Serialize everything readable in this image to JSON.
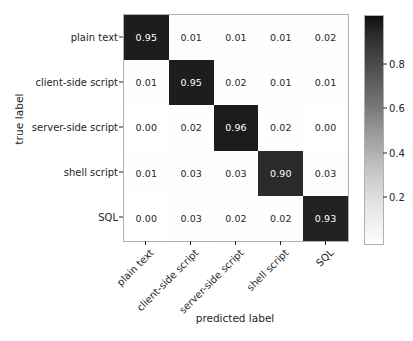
{
  "chart_data": {
    "type": "heatmap",
    "title": "",
    "xlabel": "predicted label",
    "ylabel": "true label",
    "categories": [
      "plain text",
      "client-side script",
      "server-side script",
      "shell script",
      "SQL"
    ],
    "x_tick_labels": [
      "plain text",
      "client-side script",
      "server-side script",
      "shell script",
      "SQL"
    ],
    "y_tick_labels": [
      "plain text",
      "client-side script",
      "server-side script",
      "shell script",
      "SQL"
    ],
    "rows": [
      {
        "label": "plain text",
        "values": [
          0.95,
          0.01,
          0.01,
          0.01,
          0.02
        ]
      },
      {
        "label": "client-side script",
        "values": [
          0.01,
          0.95,
          0.02,
          0.01,
          0.01
        ]
      },
      {
        "label": "server-side script",
        "values": [
          0.0,
          0.02,
          0.96,
          0.02,
          0.0
        ]
      },
      {
        "label": "shell script",
        "values": [
          0.01,
          0.03,
          0.03,
          0.9,
          0.03
        ]
      },
      {
        "label": "SQL",
        "values": [
          0.0,
          0.03,
          0.02,
          0.02,
          0.93
        ]
      }
    ],
    "cell_text": [
      [
        "0.95",
        "0.01",
        "0.01",
        "0.01",
        "0.02"
      ],
      [
        "0.01",
        "0.95",
        "0.02",
        "0.01",
        "0.01"
      ],
      [
        "0.00",
        "0.02",
        "0.96",
        "0.02",
        "0.00"
      ],
      [
        "0.01",
        "0.03",
        "0.03",
        "0.90",
        "0.03"
      ],
      [
        "0.00",
        "0.03",
        "0.02",
        "0.02",
        "0.93"
      ]
    ],
    "colormap": "Greys",
    "clim": [
      0.0,
      1.0
    ],
    "grid": false,
    "legend": "colorbar",
    "legend_position": "right",
    "colorbar": {
      "ticks": [
        0.2,
        0.4,
        0.6,
        0.8
      ],
      "tick_labels": [
        "0.2",
        "0.4",
        "0.6",
        "0.8"
      ],
      "vmin": 0.0,
      "vmax": 1.0,
      "low_color": "#ffffff",
      "high_color": "#101010"
    },
    "x_tick_rotation": -45,
    "text_color_light": "#ffffff",
    "text_color_dark": "#262626"
  }
}
